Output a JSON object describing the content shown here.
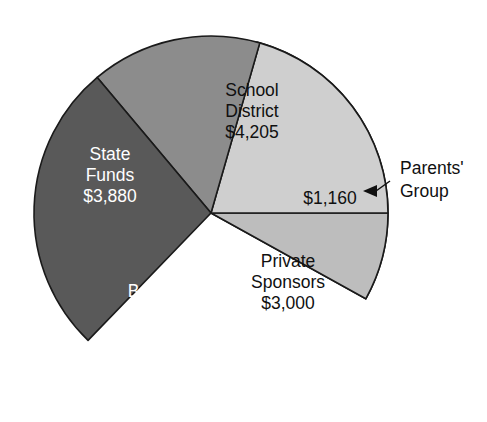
{
  "chart_data": {
    "type": "pie",
    "title": "",
    "subtitle": "",
    "xlabel": "",
    "ylabel": "",
    "units": "USD",
    "total": 14500,
    "legend_position": "none",
    "grid": false,
    "labels_inside_slices": true,
    "categories": [
      "School District",
      "Parents' Group",
      "Private Sponsors",
      "Basketball Team",
      "State Funds"
    ],
    "values": [
      4205,
      1160,
      3000,
      2255,
      3880
    ],
    "value_labels": [
      "$4,205",
      "$1,160",
      "$3,000",
      "$2,255",
      "$3,880"
    ],
    "slices": [
      {
        "id": "school-district",
        "name": "School District",
        "name_line_1": "School",
        "name_line_2": "District",
        "value": 4205,
        "value_label": "$4,205",
        "color": "#ececec",
        "text_color": "#101010",
        "start_angle": -75,
        "end_angle": 29,
        "label_inside": true,
        "label_x": 252,
        "label_y": 112,
        "callout": false
      },
      {
        "id": "parents-group",
        "name": "Parents' Group",
        "name_line_1": "Parents'",
        "name_line_2": "Group",
        "value": 1160,
        "value_label": "$1,160",
        "color": "#bdbdbd",
        "text_color": "#101010",
        "start_angle": 29,
        "end_angle": 0,
        "label_inside": false,
        "label_x": 330,
        "label_y": 199,
        "callout": true,
        "callout_x": 400,
        "callout_y": 180,
        "arrow_tip_x": 363,
        "arrow_tip_y": 190
      },
      {
        "id": "private-sponsors",
        "name": "Private Sponsors",
        "name_line_1": "Private",
        "name_line_2": "Sponsors",
        "value": 3000,
        "value_label": "$3,000",
        "color": "#cfcfcf",
        "text_color": "#101010",
        "start_angle": 0,
        "end_angle": -74,
        "label_inside": true,
        "label_x": 288,
        "label_y": 283,
        "callout": false
      },
      {
        "id": "basketball-team",
        "name": "Basketball Team",
        "name_line_1": "Basketball",
        "name_line_2": "Team",
        "value": 2255,
        "value_label": "$2,255",
        "color": "#8c8c8c",
        "text_color": "#ffffff",
        "start_angle": -74,
        "end_angle": -130,
        "label_inside": true,
        "label_x": 168,
        "label_y": 313,
        "callout": false
      },
      {
        "id": "state-funds",
        "name": "State Funds",
        "name_line_1": "State",
        "name_line_2": "Funds",
        "value": 3880,
        "value_label": "$3,880",
        "color": "#595959",
        "text_color": "#ffffff",
        "start_angle": -130,
        "end_angle": -226,
        "label_inside": true,
        "label_x": 110,
        "label_y": 176,
        "callout": false
      }
    ],
    "geometry": {
      "center_x": 211,
      "center_y": 213,
      "radius": 177,
      "outline_color": "#1a1a1a"
    },
    "annotations": [
      {
        "id": "parents-group-callout",
        "text_line_1": "Parents'",
        "text_line_2": "Group",
        "points_to": "parents-group"
      }
    ]
  }
}
